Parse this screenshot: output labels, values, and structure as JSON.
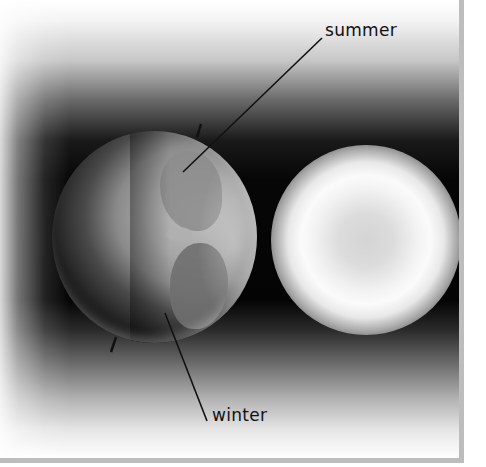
{
  "diagram": {
    "labels": {
      "summer": "summer",
      "winter": "winter"
    },
    "objects": {
      "earth": "earth-globe",
      "sun": "sun-glow",
      "axis": "tilted-rotation-axis"
    },
    "colors": {
      "background_light": "#ffffff",
      "background_dark": "#050505",
      "border": "#bdbdbd",
      "label_text": "#111111",
      "leader_line": "#111111"
    }
  }
}
